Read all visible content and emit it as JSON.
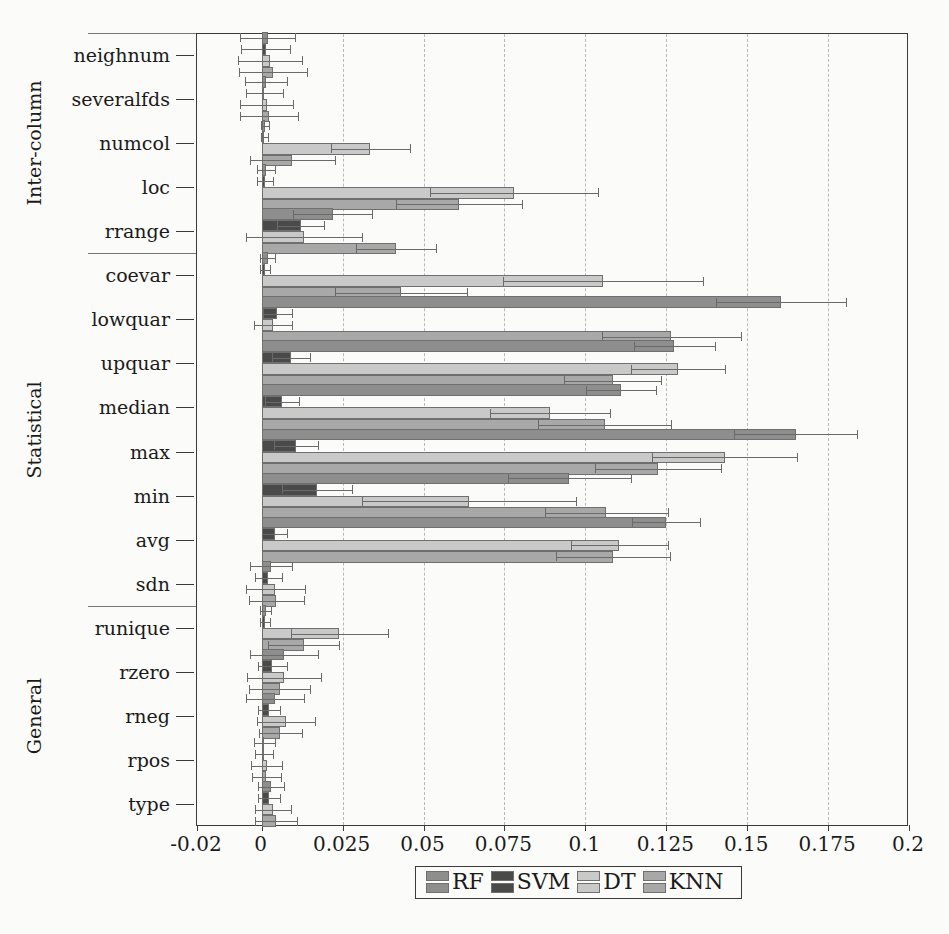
{
  "figure": {
    "title": "",
    "xlabel": "",
    "ylabel": ""
  },
  "axis": {
    "x_ticks": [
      "-0.02",
      "0",
      "0.025",
      "0.05",
      "0.075",
      "0.1",
      "0.125",
      "0.15",
      "0.175",
      "0.2"
    ]
  },
  "groups": [
    {
      "name": "Inter-column",
      "features": [
        "neighnum",
        "severalfds",
        "numcol",
        "loc",
        "rrange"
      ]
    },
    {
      "name": "Statistical",
      "features": [
        "coevar",
        "lowquar",
        "upquar",
        "median",
        "max",
        "min",
        "avg",
        "sdn"
      ]
    },
    {
      "name": "General",
      "features": [
        "runique",
        "rzero",
        "rneg",
        "rpos",
        "type"
      ]
    }
  ],
  "legend": {
    "position": "bottom-center",
    "entries": [
      {
        "label": "RF",
        "color": "#8e8e8e"
      },
      {
        "label": "SVM",
        "color": "#4a4a4a"
      },
      {
        "label": "DT",
        "color": "#c9c9c9"
      },
      {
        "label": "KNN",
        "color": "#a8a8a8"
      }
    ]
  },
  "chart_data": {
    "type": "bar",
    "orientation": "horizontal",
    "title": "",
    "xlabel": "",
    "ylabel": "",
    "xlim": [
      -0.02,
      0.2
    ],
    "xticks": [
      -0.02,
      0,
      0.025,
      0.05,
      0.075,
      0.1,
      0.125,
      0.15,
      0.175,
      0.2
    ],
    "grid": "vertical-dashed",
    "legend": [
      "RF",
      "SVM",
      "DT",
      "KNN"
    ],
    "categories": [
      "neighnum",
      "severalfds",
      "numcol",
      "loc",
      "rrange",
      "coevar",
      "lowquar",
      "upquar",
      "median",
      "max",
      "min",
      "avg",
      "sdn",
      "runique",
      "rzero",
      "rneg",
      "rpos",
      "type"
    ],
    "category_groups": [
      "Inter-column",
      "Inter-column",
      "Inter-column",
      "Inter-column",
      "Inter-column",
      "Statistical",
      "Statistical",
      "Statistical",
      "Statistical",
      "Statistical",
      "Statistical",
      "Statistical",
      "Statistical",
      "General",
      "General",
      "General",
      "General",
      "General"
    ],
    "series": [
      {
        "name": "RF",
        "color": "#8e8e8e",
        "values": [
          0.0018,
          0.0012,
          0.001,
          0.0012,
          0.022,
          0.0018,
          0.1605,
          0.1275,
          0.111,
          0.165,
          0.095,
          0.125,
          0.003,
          0.0012,
          0.007,
          0.004,
          0.0008,
          0.0028
        ],
        "err": [
          0.0085,
          0.0065,
          0.0013,
          0.0028,
          0.0122,
          0.0022,
          0.02,
          0.0125,
          0.0108,
          0.019,
          0.019,
          0.0105,
          0.0065,
          0.0018,
          0.0105,
          0.009,
          0.0032,
          0.004
        ]
      },
      {
        "name": "SVM",
        "color": "#4a4a4a",
        "values": [
          0.0012,
          0.0008,
          0.0008,
          0.001,
          0.012,
          0.001,
          0.0048,
          0.009,
          0.0062,
          0.0105,
          0.017,
          0.004,
          0.002,
          0.001,
          0.0032,
          0.0022,
          0.0006,
          0.0022
        ],
        "err": [
          0.0075,
          0.0058,
          0.001,
          0.0024,
          0.0072,
          0.0015,
          0.0045,
          0.0058,
          0.0052,
          0.0068,
          0.0108,
          0.0038,
          0.0042,
          0.0015,
          0.0045,
          0.0035,
          0.0028,
          0.0035
        ]
      },
      {
        "name": "DT",
        "color": "#c9c9c9",
        "values": [
          0.0025,
          0.0015,
          0.0335,
          0.078,
          0.013,
          0.1055,
          0.0035,
          0.1285,
          0.089,
          0.143,
          0.064,
          0.1105,
          0.0042,
          0.024,
          0.0068,
          0.0075,
          0.0016,
          0.0035
        ],
        "err": [
          0.0098,
          0.0082,
          0.0122,
          0.026,
          0.018,
          0.031,
          0.006,
          0.0145,
          0.0185,
          0.0225,
          0.033,
          0.015,
          0.0092,
          0.015,
          0.0115,
          0.009,
          0.0048,
          0.0055
        ]
      },
      {
        "name": "KNN",
        "color": "#a8a8a8",
        "values": [
          0.0035,
          0.0022,
          0.0095,
          0.061,
          0.0415,
          0.043,
          0.1265,
          0.1085,
          0.106,
          0.1225,
          0.1065,
          0.1085,
          0.0045,
          0.013,
          0.0055,
          0.0058,
          0.0014,
          0.0045
        ],
        "err": [
          0.0105,
          0.009,
          0.013,
          0.0195,
          0.0125,
          0.0205,
          0.0215,
          0.015,
          0.0205,
          0.0195,
          0.019,
          0.0175,
          0.0085,
          0.011,
          0.0095,
          0.0065,
          0.0045,
          0.0065
        ]
      }
    ]
  }
}
